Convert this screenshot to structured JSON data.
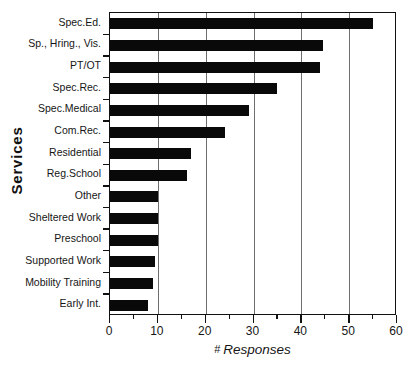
{
  "chart_data": {
    "type": "bar",
    "orientation": "horizontal",
    "title": "",
    "xlabel": "# Responses",
    "ylabel": "Services",
    "xlim": [
      0,
      60
    ],
    "ylim": null,
    "grid": true,
    "legend": null,
    "x_major_ticks": [
      0,
      10,
      20,
      30,
      40,
      50,
      60
    ],
    "x_minor_tick_step": 5,
    "x_tick_labels": [
      "0",
      "10",
      "20",
      "30",
      "40",
      "50",
      "60"
    ],
    "bar_color": "#090909",
    "categories": [
      "Spec.Ed.",
      "Sp., Hring., Vis.",
      "PT/OT",
      "Spec.Rec.",
      "Spec.Medical",
      "Com.Rec.",
      "Residential",
      "Reg.School",
      "Other",
      "Sheltered Work",
      "Preschool",
      "Supported Work",
      "Mobility Training",
      "Early Int."
    ],
    "values": [
      55,
      44.5,
      44,
      35,
      29,
      24,
      17,
      16,
      10,
      10,
      10,
      9.5,
      9,
      8
    ]
  },
  "axis_titles": {
    "y": "Services",
    "x_prefix": "#",
    "x_main": "Responses"
  }
}
